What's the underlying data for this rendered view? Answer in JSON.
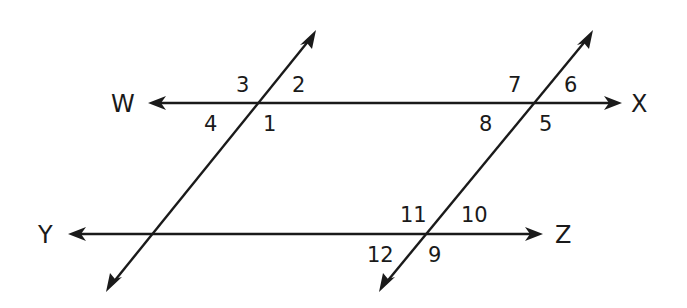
{
  "diagram": {
    "type": "parallel-lines-cut-by-transversals",
    "lines": {
      "wx": {
        "label_left": "W",
        "label_right": "X",
        "y": 103,
        "x1": 148,
        "x2": 622
      },
      "yz": {
        "label_left": "Y",
        "label_right": "Z",
        "y": 234,
        "x1": 68,
        "x2": 543
      },
      "left_transversal": {
        "top": [
          316,
          30
        ],
        "bottom": [
          106,
          292
        ]
      },
      "right_transversal": {
        "top": [
          593,
          30
        ],
        "bottom": [
          379,
          292
        ]
      }
    },
    "point_labels": {
      "W": "W",
      "X": "X",
      "Y": "Y",
      "Z": "Z"
    },
    "angle_labels": {
      "a1": "1",
      "a2": "2",
      "a3": "3",
      "a4": "4",
      "a5": "5",
      "a6": "6",
      "a7": "7",
      "a8": "8",
      "a9": "9",
      "a10": "10",
      "a11": "11",
      "a12": "12"
    },
    "colors": {
      "stroke": "#1a1a1a",
      "background": "#ffffff"
    }
  }
}
